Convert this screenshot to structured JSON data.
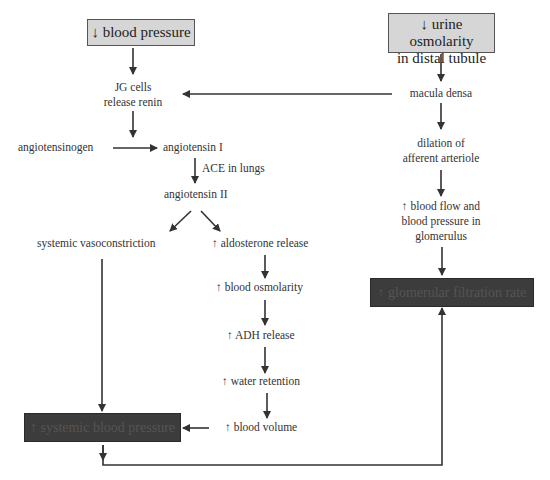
{
  "diagram": {
    "type": "flowchart",
    "start_nodes": {
      "blood_pressure": "↓ blood pressure",
      "urine_osmolarity_line1": "↓ urine osmolarity",
      "urine_osmolarity_line2": "in distal tubule"
    },
    "left_chain": {
      "jg_line1": "JG cells",
      "jg_line2": "release renin",
      "angiotensinogen": "angiotensinogen",
      "angiotensin_i": "angiotensin I",
      "ace": "ACE in lungs",
      "angiotensin_ii": "angiotensin II",
      "vasoconstriction": "systemic vasoconstriction",
      "aldosterone": "↑ aldosterone release",
      "blood_osmolarity": "↑ blood osmolarity",
      "adh": "↑ ADH release",
      "water_retention": "↑ water retention",
      "blood_volume": "↑ blood volume"
    },
    "right_chain": {
      "macula_densa": "macula densa",
      "dilation_line1": "dilation of",
      "dilation_line2": "afferent arteriole",
      "flow_line1": "↑ blood flow and",
      "flow_line2": "blood pressure in",
      "flow_line3": "glomerulus"
    },
    "outcomes": {
      "systemic_bp": "↑ systemic blood pressure",
      "gfr": "↑ glomerular filtration rate"
    },
    "colors": {
      "start_box_fill": "#d6d6d6",
      "start_box_border": "#555555",
      "outcome_box_fill": "#3c3c3c",
      "arrow": "#333333"
    },
    "edges": [
      [
        "↓ blood pressure",
        "JG cells release renin"
      ],
      [
        "↓ urine osmolarity in distal tubule",
        "macula densa"
      ],
      [
        "macula densa",
        "JG cells release renin"
      ],
      [
        "JG cells release renin",
        "angiotensin I"
      ],
      [
        "angiotensinogen",
        "angiotensin I"
      ],
      [
        "angiotensin I",
        "angiotensin II",
        "ACE in lungs"
      ],
      [
        "angiotensin II",
        "systemic vasoconstriction"
      ],
      [
        "angiotensin II",
        "↑ aldosterone release"
      ],
      [
        "↑ aldosterone release",
        "↑ blood osmolarity"
      ],
      [
        "↑ blood osmolarity",
        "↑ ADH release"
      ],
      [
        "↑ ADH release",
        "↑ water retention"
      ],
      [
        "↑ water retention",
        "↑ blood volume"
      ],
      [
        "↑ blood volume",
        "↑ systemic blood pressure"
      ],
      [
        "systemic vasoconstriction",
        "↑ systemic blood pressure"
      ],
      [
        "↑ systemic blood pressure",
        "↑ glomerular filtration rate"
      ],
      [
        "macula densa",
        "dilation of afferent arteriole"
      ],
      [
        "dilation of afferent arteriole",
        "↑ blood flow and blood pressure in glomerulus"
      ],
      [
        "↑ blood flow and blood pressure in glomerulus",
        "↑ glomerular filtration rate"
      ]
    ]
  }
}
